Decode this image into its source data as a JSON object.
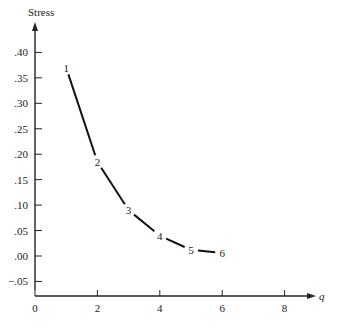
{
  "chart_data": {
    "type": "line",
    "title": "",
    "xlabel": "q",
    "ylabel": "Stress",
    "xlim": [
      0,
      9
    ],
    "ylim": [
      -0.05,
      0.43
    ],
    "grid": false,
    "legend": null,
    "x_ticks": [
      {
        "value": 0,
        "label": "0"
      },
      {
        "value": 2,
        "label": "2"
      },
      {
        "value": 4,
        "label": "4"
      },
      {
        "value": 6,
        "label": "6"
      },
      {
        "value": 8,
        "label": "8"
      }
    ],
    "y_ticks": [
      {
        "value": 0.4,
        "label": ".40"
      },
      {
        "value": 0.35,
        "label": ".35"
      },
      {
        "value": 0.3,
        "label": ".30"
      },
      {
        "value": 0.25,
        "label": ".25"
      },
      {
        "value": 0.2,
        "label": ".20"
      },
      {
        "value": 0.15,
        "label": ".15"
      },
      {
        "value": 0.1,
        "label": ".10"
      },
      {
        "value": 0.05,
        "label": ".05"
      },
      {
        "value": 0.0,
        "label": ".00"
      },
      {
        "value": -0.05,
        "label": "−.05"
      }
    ],
    "series": [
      {
        "name": "Stress",
        "x": [
          1,
          2,
          3,
          4,
          5,
          6
        ],
        "values": [
          0.37,
          0.185,
          0.09,
          0.04,
          0.012,
          0.006
        ],
        "point_labels": [
          "1",
          "2",
          "3",
          "4",
          "5",
          "6"
        ]
      }
    ]
  }
}
